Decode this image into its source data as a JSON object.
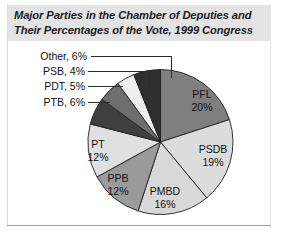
{
  "figure": {
    "title": "Major Parties in the Chamber of Deputies and Their Percentages of the Vote, 1999 Congress"
  },
  "chart_data": {
    "type": "pie",
    "title": "Major Parties in the Chamber of Deputies and Their Percentages of the Vote, 1999 Congress",
    "xlabel": "",
    "ylabel": "",
    "legend": "none",
    "grid": false,
    "start_angle_deg": 0,
    "direction": "clockwise",
    "categories": [
      "PFL",
      "PSDB",
      "PMBD",
      "PPB",
      "PT",
      "PTB",
      "PDT",
      "PSB",
      "Other"
    ],
    "values": [
      20,
      19,
      16,
      12,
      12,
      6,
      5,
      4,
      6
    ],
    "unit": "%",
    "colors": [
      "#7f7f7f",
      "#dcdcdc",
      "#d8d8d8",
      "#9a9a9a",
      "#e0e0e0",
      "#3f3f3f",
      "#6e6e6e",
      "#ededed",
      "#2f2f2f"
    ],
    "slices": [
      {
        "label": "PFL",
        "value": 20,
        "text": "PFL\n20%",
        "color": "#7f7f7f",
        "label_position": "inside"
      },
      {
        "label": "PSDB",
        "value": 19,
        "text": "PSDB\n19%",
        "color": "#dcdcdc",
        "label_position": "inside"
      },
      {
        "label": "PMBD",
        "value": 16,
        "text": "PMBD\n16%",
        "color": "#d8d8d8",
        "label_position": "inside"
      },
      {
        "label": "PPB",
        "value": 12,
        "text": "PPB\n12%",
        "color": "#9a9a9a",
        "label_position": "inside"
      },
      {
        "label": "PT",
        "value": 12,
        "text": "PT\n12%",
        "color": "#e0e0e0",
        "label_position": "inside"
      },
      {
        "label": "PTB",
        "value": 6,
        "text": "PTB, 6%",
        "color": "#3f3f3f",
        "label_position": "outside"
      },
      {
        "label": "PDT",
        "value": 5,
        "text": "PDT, 5%",
        "color": "#6e6e6e",
        "label_position": "outside"
      },
      {
        "label": "PSB",
        "value": 4,
        "text": "PSB, 4%",
        "color": "#ededed",
        "label_position": "outside"
      },
      {
        "label": "Other",
        "value": 6,
        "text": "Other, 6%",
        "color": "#2f2f2f",
        "label_position": "outside"
      }
    ]
  },
  "labels": {
    "pfl_name": "PFL",
    "pfl_pct": "20%",
    "psdb_name": "PSDB",
    "psdb_pct": "19%",
    "pmbd_name": "PMBD",
    "pmbd_pct": "16%",
    "ppb_name": "PPB",
    "ppb_pct": "12%",
    "pt_name": "PT",
    "pt_pct": "12%",
    "other": "Other, 6%",
    "psb": "PSB, 4%",
    "pdt": "PDT, 5%",
    "ptb": "PTB, 6%"
  }
}
